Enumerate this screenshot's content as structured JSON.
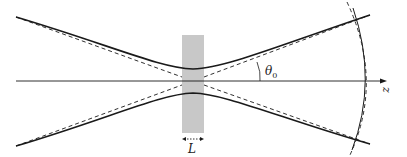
{
  "diagram": {
    "labels": {
      "angle": "θ",
      "angle_sub": "0",
      "thickness": "L",
      "axis": "z"
    },
    "colors": {
      "slab": "#c8c8c8",
      "line": "#1a1a1a",
      "background": "#ffffff"
    },
    "elements": [
      "solid beam envelope (upper and lower)",
      "dashed asymptote lines",
      "optical axis arrow z",
      "gray slab of thickness L",
      "angle θ0 arc",
      "solid and dashed wavefront arcs"
    ]
  }
}
